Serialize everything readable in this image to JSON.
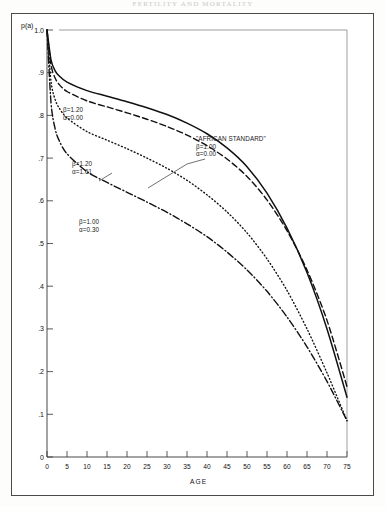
{
  "page": {
    "running_head": "FERTILITY AND MORTALITY"
  },
  "figure": {
    "ylabel": "p(a)",
    "xlabel": "AGE"
  },
  "chart_data": {
    "type": "line",
    "title": "",
    "xlabel": "AGE",
    "ylabel": "p(a)",
    "xlim": [
      0,
      75
    ],
    "ylim": [
      0,
      1.0
    ],
    "grid": false,
    "legend": "annotations-inline",
    "xticks": [
      0,
      5,
      10,
      15,
      20,
      25,
      30,
      35,
      40,
      45,
      50,
      55,
      60,
      65,
      70,
      75
    ],
    "xticklabels": [
      "0",
      "5",
      "10",
      "15",
      "20",
      "25",
      "30",
      "35",
      "40",
      "45",
      "50",
      "55",
      "60",
      "65",
      "70",
      "75"
    ],
    "yticks": [
      0,
      0.1,
      0.2,
      0.3,
      0.4,
      0.5,
      0.6,
      0.7,
      0.8,
      0.9,
      1.0
    ],
    "yticklabels": [
      "0",
      ".1",
      ".2",
      ".3",
      ".4",
      ".5",
      ".6",
      ".7",
      ".8",
      ".9",
      "1.0"
    ],
    "x": [
      0,
      1,
      2,
      3,
      5,
      10,
      15,
      20,
      25,
      30,
      35,
      40,
      45,
      50,
      55,
      60,
      65,
      70,
      75
    ],
    "series": [
      {
        "name": "AFRICAN STANDARD",
        "beta": "1.00",
        "alpha": "0.00",
        "linestyle": "solid",
        "label": "\"AFRICAN STANDARD\"",
        "values": [
          1.0,
          0.93,
          0.905,
          0.893,
          0.878,
          0.858,
          0.845,
          0.832,
          0.818,
          0.802,
          0.782,
          0.757,
          0.724,
          0.68,
          0.618,
          0.536,
          0.432,
          0.3,
          0.14
        ]
      },
      {
        "name": "beta120-alpha000",
        "beta": "1.20",
        "alpha": "0.00",
        "linestyle": "dashed",
        "values": [
          1.0,
          0.918,
          0.888,
          0.873,
          0.856,
          0.834,
          0.82,
          0.806,
          0.791,
          0.774,
          0.754,
          0.729,
          0.698,
          0.657,
          0.602,
          0.53,
          0.438,
          0.32,
          0.165
        ]
      },
      {
        "name": "beta120-alpha161",
        "beta": "1.20",
        "alpha": "1.61",
        "linestyle": "dotted",
        "values": [
          1.0,
          0.88,
          0.838,
          0.818,
          0.794,
          0.762,
          0.742,
          0.722,
          0.7,
          0.676,
          0.648,
          0.614,
          0.574,
          0.525,
          0.464,
          0.39,
          0.3,
          0.197,
          0.085
        ]
      },
      {
        "name": "beta100-alpha030",
        "beta": "1.00",
        "alpha": "0.30",
        "linestyle": "dashdot",
        "values": [
          1.0,
          0.83,
          0.77,
          0.742,
          0.71,
          0.668,
          0.643,
          0.62,
          0.597,
          0.573,
          0.546,
          0.516,
          0.48,
          0.438,
          0.388,
          0.328,
          0.258,
          0.177,
          0.085
        ]
      }
    ],
    "annotations": [
      {
        "id": "anno-a",
        "lines": [
          "β=1.20",
          "α=0.00"
        ]
      },
      {
        "id": "anno-b",
        "lines": [
          "β=1.20",
          "α=1.61"
        ]
      },
      {
        "id": "anno-c",
        "lines": [
          "β=1.00",
          "α=0.30"
        ]
      },
      {
        "id": "anno-d",
        "lines": [
          "\"AFRICAN STANDARD\"",
          "β=1.00",
          "α=0.00"
        ]
      }
    ]
  }
}
